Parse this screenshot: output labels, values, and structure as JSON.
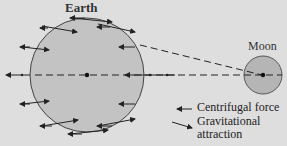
{
  "labels": {
    "earth": "Earth",
    "moon": "Moon"
  },
  "legend": {
    "centrifugal": "Centrifugal force",
    "gravitational_line1": "Gravitational",
    "gravitational_line2": "attraction"
  },
  "colors": {
    "background": "#dedede",
    "earth_fill": "#c3c3c3",
    "moon_fill": "#b5b5b5",
    "stroke": "#333333"
  }
}
